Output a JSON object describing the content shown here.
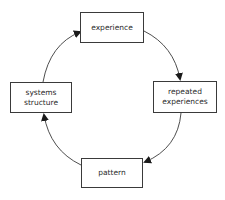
{
  "diagram": {
    "type": "cycle",
    "direction": "clockwise",
    "nodes": [
      {
        "id": "experience",
        "label": "experience",
        "position": "top"
      },
      {
        "id": "repeated_experiences",
        "label": "repeated\nexperiences",
        "position": "right"
      },
      {
        "id": "pattern",
        "label": "pattern",
        "position": "bottom"
      },
      {
        "id": "systems_structure",
        "label": "systems\nstructure",
        "position": "left"
      }
    ],
    "edges": [
      {
        "from": "experience",
        "to": "repeated_experiences"
      },
      {
        "from": "repeated_experiences",
        "to": "pattern"
      },
      {
        "from": "pattern",
        "to": "systems_structure"
      },
      {
        "from": "systems_structure",
        "to": "experience"
      }
    ],
    "colors": {
      "stroke": "#3a3a3a",
      "text": "#2a2a2a",
      "background": "#ffffff"
    }
  }
}
